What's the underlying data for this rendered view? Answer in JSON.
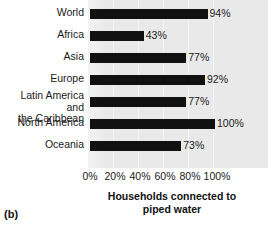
{
  "figure": {
    "panel_label": "(b)",
    "axis_title_line1": "Households connected to",
    "axis_title_line2": "piped water"
  },
  "chart_data": {
    "type": "bar",
    "orientation": "horizontal",
    "title": "",
    "xlabel": "Households connected to piped water",
    "ylabel": "",
    "xlim": [
      0,
      100
    ],
    "xticks": [
      "0%",
      "20%",
      "40%",
      "60%",
      "80%",
      "100%"
    ],
    "xtick_values": [
      0,
      20,
      40,
      60,
      80,
      100
    ],
    "grid": true,
    "legend": "none",
    "categories": [
      "World",
      "Africa",
      "Asia",
      "Europe",
      "Latin America and\nthe Caribbean",
      "North America",
      "Oceania"
    ],
    "values": [
      94,
      43,
      77,
      92,
      77,
      100,
      73
    ],
    "data_labels": [
      "94%",
      "43%",
      "77%",
      "92%",
      "77%",
      "100%",
      "73%"
    ],
    "bar_color": "#111111",
    "plot_background": "#e9e9e9"
  }
}
